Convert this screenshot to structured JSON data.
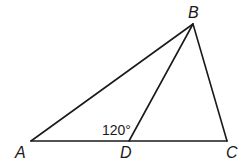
{
  "diagram": {
    "type": "triangle",
    "points": {
      "A": {
        "label": "A",
        "x": 31,
        "y": 141
      },
      "B": {
        "label": "B",
        "x": 193,
        "y": 24
      },
      "C": {
        "label": "C",
        "x": 227,
        "y": 141
      },
      "D": {
        "label": "D",
        "x": 129,
        "y": 141
      }
    },
    "segments": [
      "AB",
      "BC",
      "AC",
      "BD"
    ],
    "angle_label": "120°",
    "angle_at": "ADB"
  }
}
